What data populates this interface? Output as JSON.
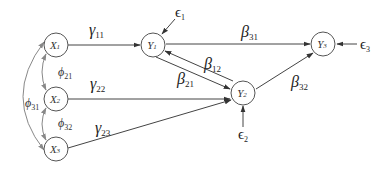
{
  "diagram": {
    "type": "structural-equation-path-diagram",
    "nodes": {
      "X1": {
        "letter": "X",
        "sub": "1"
      },
      "X2": {
        "letter": "X",
        "sub": "2"
      },
      "X3": {
        "letter": "X",
        "sub": "3"
      },
      "Y1": {
        "letter": "Y",
        "sub": "1"
      },
      "Y2": {
        "letter": "Y",
        "sub": "2"
      },
      "Y3": {
        "letter": "Y",
        "sub": "3"
      }
    },
    "errors": {
      "e1": {
        "symbol": "ϵ",
        "sub": "1",
        "target": "Y1"
      },
      "e2": {
        "symbol": "ϵ",
        "sub": "2",
        "target": "Y2"
      },
      "e3": {
        "symbol": "ϵ",
        "sub": "3",
        "target": "Y3"
      }
    },
    "paths": {
      "gamma11": {
        "symbol": "γ",
        "sub": "11",
        "from": "X1",
        "to": "Y1"
      },
      "gamma22": {
        "symbol": "γ",
        "sub": "22",
        "from": "X2",
        "to": "Y2"
      },
      "gamma23": {
        "symbol": "γ",
        "sub": "23",
        "from": "X3",
        "to": "Y2"
      },
      "beta31": {
        "symbol": "β",
        "sub": "31",
        "from": "Y1",
        "to": "Y3"
      },
      "beta12": {
        "symbol": "β",
        "sub": "12",
        "from": "Y2",
        "to": "Y1"
      },
      "beta21": {
        "symbol": "β",
        "sub": "21",
        "from": "Y1",
        "to": "Y2"
      },
      "beta32": {
        "symbol": "β",
        "sub": "32",
        "from": "Y2",
        "to": "Y3"
      }
    },
    "covariances": {
      "phi21": {
        "symbol": "ϕ",
        "sub": "21",
        "between": [
          "X1",
          "X2"
        ]
      },
      "phi32": {
        "symbol": "ϕ",
        "sub": "32",
        "between": [
          "X2",
          "X3"
        ]
      },
      "phi31": {
        "symbol": "ϕ",
        "sub": "31",
        "between": [
          "X1",
          "X3"
        ]
      }
    }
  }
}
